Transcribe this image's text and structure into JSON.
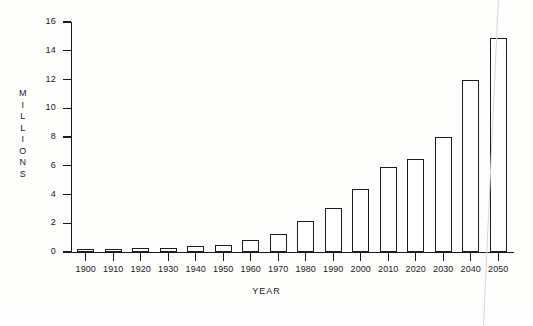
{
  "chart_data": {
    "type": "bar",
    "title": "",
    "xlabel": "YEAR",
    "ylabel": "MILLIONS",
    "ylabel_letters": [
      "M",
      "I",
      "L",
      "L",
      "I",
      "O",
      "N",
      "S"
    ],
    "categories": [
      "1900",
      "1910",
      "1920",
      "1930",
      "1940",
      "1950",
      "1960",
      "1970",
      "1980",
      "1990",
      "2000",
      "2010",
      "2020",
      "2030",
      "2040",
      "2050"
    ],
    "values": [
      0.15,
      0.2,
      0.25,
      0.3,
      0.4,
      0.5,
      0.85,
      1.25,
      2.15,
      3.05,
      4.4,
      5.9,
      6.45,
      8.0,
      12.0,
      14.9
    ],
    "ylim": [
      0,
      16
    ],
    "ytick_values": [
      0,
      2,
      4,
      6,
      8,
      10,
      12,
      14,
      16
    ],
    "ytick_labels": [
      "0",
      "2",
      "4",
      "6",
      "8",
      "10",
      "12",
      "14",
      "16"
    ],
    "grid": false,
    "legend": null,
    "bar_style": "open-outline",
    "colors": {
      "bar_outline": "#1c1c1c",
      "bar_fill": "#ffffff",
      "axis": "#1a1a1a",
      "text": "#1a1a1a",
      "background": "#fdfdfc"
    }
  }
}
